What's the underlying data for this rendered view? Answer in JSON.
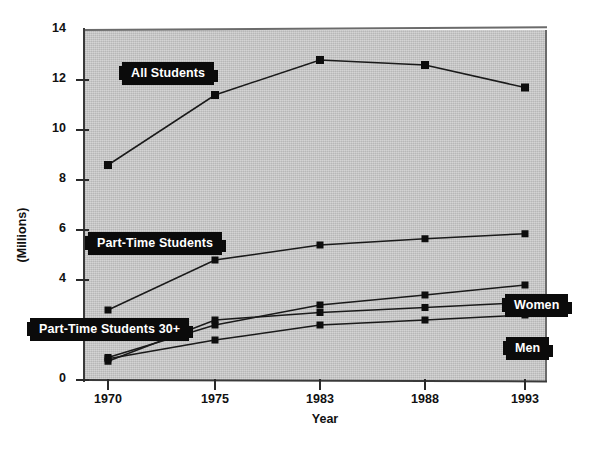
{
  "chart_data": {
    "type": "line",
    "title": "",
    "xlabel": "Year",
    "ylabel": "(Millions)",
    "x": [
      1970,
      1975,
      1983,
      1988,
      1993
    ],
    "categories": [
      "1970",
      "1975",
      "1983",
      "1988",
      "1993"
    ],
    "xtick_labels": [
      "1970",
      "1975",
      "1983",
      "1988",
      "1993"
    ],
    "ytick_labels": [
      "0",
      "2",
      "4",
      "6",
      "8",
      "10",
      "12",
      "14"
    ],
    "ytick_values": [
      0,
      2,
      4,
      6,
      8,
      10,
      12,
      14
    ],
    "ylim": [
      0,
      14
    ],
    "grid": false,
    "legend_position": "inline-callouts",
    "marker": "square",
    "series": [
      {
        "name": "All Students",
        "label": "All Students",
        "values": [
          8.6,
          11.4,
          12.8,
          12.6,
          11.7
        ]
      },
      {
        "name": "Part-Time Students",
        "label": "Part-Time Students",
        "values": [
          2.8,
          4.8,
          5.4,
          5.65,
          5.85
        ]
      },
      {
        "name": "Women",
        "label": "Women",
        "values": [
          0.9,
          2.2,
          3.0,
          3.4,
          3.8
        ]
      },
      {
        "name": "Part-Time Students 30+",
        "label": "Part-Time Students 30+",
        "values": [
          0.75,
          2.4,
          2.7,
          2.9,
          3.1
        ]
      },
      {
        "name": "Men",
        "label": "Men",
        "values": [
          0.85,
          1.6,
          2.2,
          2.4,
          2.6
        ]
      }
    ],
    "colors": {
      "plot_background": "#c9c9c9",
      "page_background": "#ffffff",
      "line": "#1a1a1a",
      "marker": "#0d0d0d",
      "callout_background": "#0b0b0b",
      "callout_text": "#ffffff",
      "axis": "#2a2a2a"
    }
  }
}
